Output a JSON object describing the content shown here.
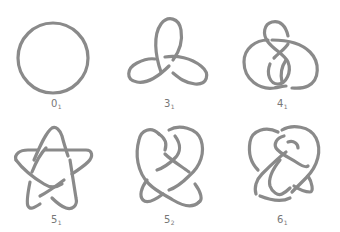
{
  "stroke_color": "#8a8a8a",
  "knots": [
    {
      "id": "0_1",
      "number": "0",
      "index": "1",
      "name": "unknot",
      "crossings": 0
    },
    {
      "id": "3_1",
      "number": "3",
      "index": "1",
      "name": "trefoil",
      "crossings": 3
    },
    {
      "id": "4_1",
      "number": "4",
      "index": "1",
      "name": "figure-eight",
      "crossings": 4
    },
    {
      "id": "5_1",
      "number": "5",
      "index": "1",
      "name": "cinquefoil",
      "crossings": 5
    },
    {
      "id": "5_2",
      "number": "5",
      "index": "2",
      "name": "three-twist",
      "crossings": 5
    },
    {
      "id": "6_1",
      "number": "6",
      "index": "1",
      "name": "stevedore",
      "crossings": 6
    }
  ]
}
